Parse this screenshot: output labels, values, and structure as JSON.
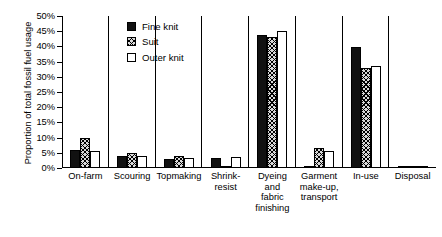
{
  "chart_data": {
    "type": "bar",
    "title": "",
    "xlabel": "",
    "ylabel": "Proportion of total fossil fuel usage",
    "ylim": [
      0,
      50
    ],
    "ytick_labels": [
      "0%",
      "5%",
      "10%",
      "15%",
      "20%",
      "25%",
      "30%",
      "35%",
      "40%",
      "45%",
      "50%"
    ],
    "ytick_values": [
      0,
      5,
      10,
      15,
      20,
      25,
      30,
      35,
      40,
      45,
      50
    ],
    "grid": false,
    "legend_position": "upper-left-inside",
    "categories": [
      "On-farm",
      "Scouring",
      "Topmaking",
      "Shrink-\nresist",
      "Dyeing\nand\nfabric\nfinishing",
      "Garment\nmake-up,\ntransport",
      "In-use",
      "Disposal"
    ],
    "series": [
      {
        "name": "Fine knit",
        "fill": "solid-black",
        "color": "#111111",
        "values": [
          6.0,
          3.9,
          3.0,
          3.4,
          43.9,
          0.7,
          39.9,
          0.2
        ]
      },
      {
        "name": "Suit",
        "fill": "cross-hatch-gray",
        "color": "#d8d8d8",
        "values": [
          9.9,
          5.1,
          4.1,
          0.0,
          43.0,
          6.5,
          33.0,
          0.2
        ]
      },
      {
        "name": "Outer knit",
        "fill": "white-outline",
        "color": "#ffffff",
        "values": [
          5.5,
          3.9,
          3.4,
          3.7,
          45.2,
          5.6,
          33.6,
          0.2
        ]
      }
    ]
  }
}
